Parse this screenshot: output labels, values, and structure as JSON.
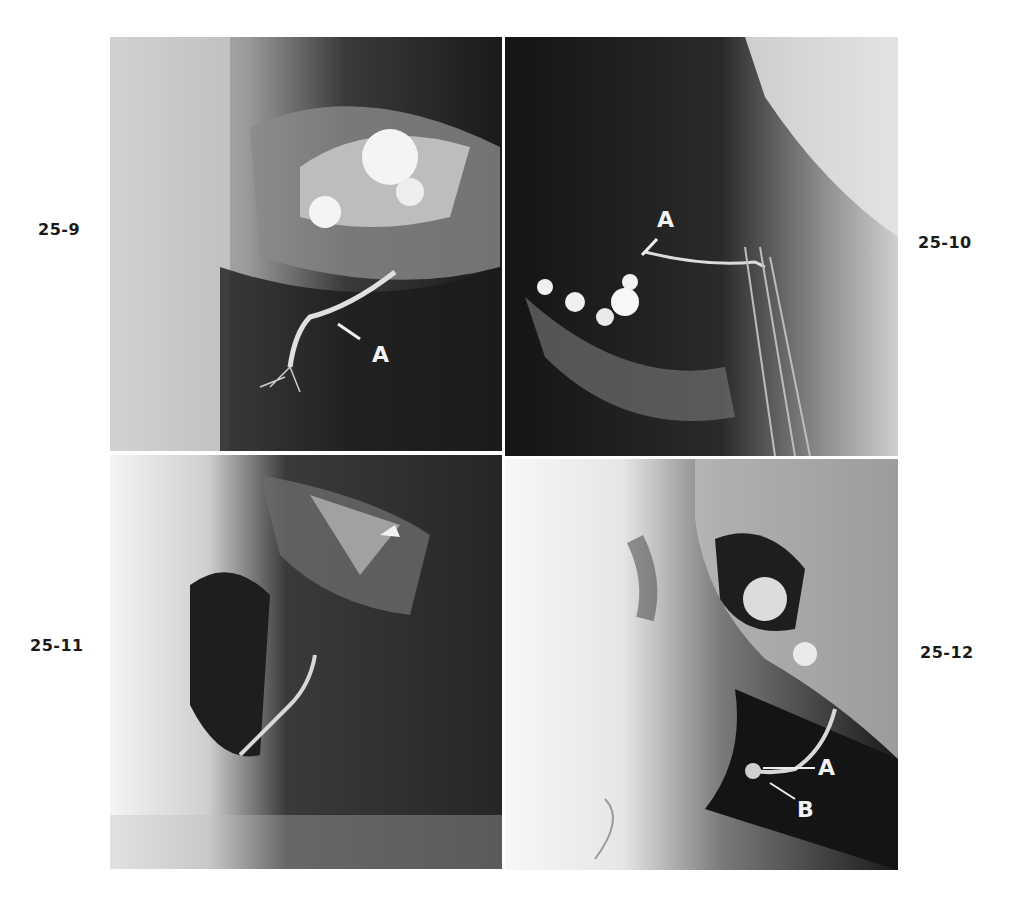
{
  "figure": {
    "panels": [
      {
        "id": "25-9",
        "label": "25-9",
        "annotations": [
          "A"
        ]
      },
      {
        "id": "25-10",
        "label": "25-10",
        "annotations": [
          "A"
        ]
      },
      {
        "id": "25-11",
        "label": "25-11",
        "annotations": []
      },
      {
        "id": "25-12",
        "label": "25-12",
        "annotations": [
          "A",
          "B"
        ]
      }
    ]
  }
}
